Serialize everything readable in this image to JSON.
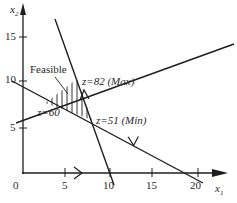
{
  "axes": {
    "x_label": "x",
    "x_sub": "1",
    "y_label": "x",
    "y_sub": "2",
    "x_ticks": [
      "0",
      "5",
      "10",
      "15",
      "20"
    ],
    "y_ticks": [
      "15",
      "10",
      "5"
    ]
  },
  "annotations": {
    "feasible": "Feasible",
    "z_max": "z=82 (Max)",
    "z_60": "z=60",
    "z_min": "z=51 (Min)"
  },
  "colors": {
    "line": "#1e1e1e",
    "text": "#2a2a2a",
    "background": "#ffffff"
  }
}
